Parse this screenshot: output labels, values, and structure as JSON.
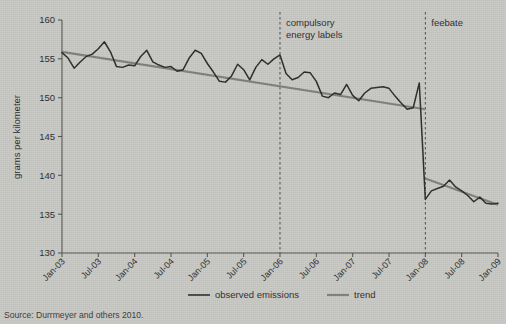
{
  "figure": {
    "source_note": "Source: Durrmeyer and others 2010."
  },
  "legend": {
    "items": [
      {
        "label": "observed emissions",
        "color": "#2b2b29",
        "width": 1.6
      },
      {
        "label": "trend",
        "color": "#7e8079",
        "width": 2.2
      }
    ]
  },
  "annotations": [
    {
      "name": "compulsory-energy-labels",
      "line1": "compulsory",
      "line2": "energy labels",
      "at_x": "Jan-06"
    },
    {
      "name": "feebate",
      "line1": "feebate",
      "line2": "",
      "at_x": "Jan-08"
    }
  ],
  "chart_data": {
    "type": "line",
    "title": "",
    "xlabel": "",
    "ylabel": "grams per kilometer",
    "ylim": [
      130,
      160
    ],
    "yticks": [
      130,
      135,
      140,
      145,
      150,
      155,
      160
    ],
    "xlim": [
      "Jan-03",
      "Jan-09"
    ],
    "xticks": [
      "Jan-03",
      "Jul-03",
      "Jan-04",
      "Jul-04",
      "Jan-05",
      "Jul-05",
      "Jan-06",
      "Jul-06",
      "Jan-07",
      "Jul-07",
      "Jan-08",
      "Jul-08",
      "Jan-09"
    ],
    "grid": false,
    "legend_position": "bottom",
    "vlines": [
      {
        "x": "Jan-06",
        "style": "dashed",
        "label": "compulsory energy labels"
      },
      {
        "x": "Jan-08",
        "style": "dashed",
        "label": "feebate"
      }
    ],
    "series": [
      {
        "name": "observed emissions",
        "color": "#2b2b29",
        "x": [
          "Jan-03",
          "Feb-03",
          "Mar-03",
          "Apr-03",
          "May-03",
          "Jun-03",
          "Jul-03",
          "Aug-03",
          "Sep-03",
          "Oct-03",
          "Nov-03",
          "Dec-03",
          "Jan-04",
          "Feb-04",
          "Mar-04",
          "Apr-04",
          "May-04",
          "Jun-04",
          "Jul-04",
          "Aug-04",
          "Sep-04",
          "Oct-04",
          "Nov-04",
          "Dec-04",
          "Jan-05",
          "Feb-05",
          "Mar-05",
          "Apr-05",
          "May-05",
          "Jun-05",
          "Jul-05",
          "Aug-05",
          "Sep-05",
          "Oct-05",
          "Nov-05",
          "Dec-05",
          "Jan-06",
          "Feb-06",
          "Mar-06",
          "Apr-06",
          "May-06",
          "Jun-06",
          "Jul-06",
          "Aug-06",
          "Sep-06",
          "Oct-06",
          "Nov-06",
          "Dec-06",
          "Jan-07",
          "Feb-07",
          "Mar-07",
          "Apr-07",
          "May-07",
          "Jun-07",
          "Jul-07",
          "Aug-07",
          "Sep-07",
          "Oct-07",
          "Nov-07",
          "Dec-07",
          "Jan-08",
          "Feb-08",
          "Mar-08",
          "Apr-08",
          "May-08",
          "Jun-08",
          "Jul-08",
          "Aug-08",
          "Sep-08",
          "Oct-08",
          "Nov-08",
          "Dec-08",
          "Jan-09"
        ],
        "values": [
          155.8,
          155.1,
          153.8,
          154.6,
          155.3,
          155.6,
          156.3,
          157.2,
          155.9,
          154.0,
          153.9,
          154.2,
          154.1,
          155.3,
          156.1,
          154.6,
          154.2,
          153.9,
          154.0,
          153.4,
          153.6,
          155.1,
          156.1,
          155.7,
          154.4,
          153.3,
          152.1,
          152.0,
          152.8,
          154.3,
          153.6,
          152.3,
          153.9,
          154.9,
          154.3,
          155.0,
          155.5,
          153.1,
          152.3,
          152.6,
          153.3,
          153.2,
          152.1,
          150.2,
          150.0,
          150.6,
          150.4,
          151.7,
          150.3,
          149.6,
          150.6,
          151.2,
          151.3,
          151.4,
          151.2,
          150.2,
          149.3,
          148.5,
          148.7,
          151.9,
          136.9,
          138.0,
          138.3,
          138.6,
          139.4,
          138.5,
          138.0,
          137.4,
          136.6,
          137.2,
          136.4,
          136.3,
          136.4
        ]
      },
      {
        "name": "trend",
        "color": "#7e8079",
        "segments": [
          {
            "from_x": "Jan-03",
            "to_x": "Jan-08",
            "from_y": 155.9,
            "to_y": 148.5
          },
          {
            "from_x": "Jan-08",
            "to_x": "Jan-09",
            "from_y": 139.6,
            "to_y": 136.2
          }
        ]
      }
    ]
  }
}
